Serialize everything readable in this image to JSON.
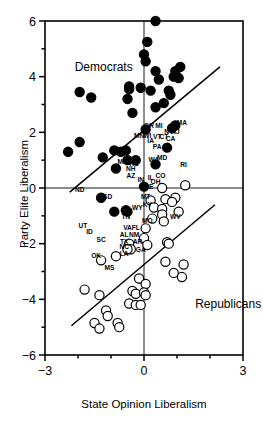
{
  "chart_data": {
    "type": "scatter",
    "title": "",
    "xlabel": "State Opinion Liberalism",
    "ylabel": "Party Elite Liberalism",
    "xlim": [
      -3,
      3
    ],
    "ylim": [
      -6,
      6
    ],
    "xticks": [
      -3,
      -2,
      -1,
      0,
      1,
      2,
      3
    ],
    "xticklabels": [
      "−3",
      "",
      "",
      "0",
      "",
      "",
      "3"
    ],
    "yticks": [
      -6,
      -5,
      -4,
      -3,
      -2,
      -1,
      0,
      1,
      2,
      3,
      4,
      5,
      6
    ],
    "yticklabels": [
      "−6",
      "",
      "−4",
      "",
      "−2",
      "",
      "0",
      "",
      "2",
      "",
      "4",
      "",
      "6"
    ],
    "grid": false,
    "legend_position": "in-plot annotations",
    "annotations": [
      {
        "text": "Democrats",
        "x": -2.1,
        "y": 4.2
      },
      {
        "text": "Republicans",
        "x": 1.55,
        "y": -4.3
      }
    ],
    "reference_lines": [
      {
        "name": "zero-vertical",
        "orientation": "vertical",
        "value": 0
      },
      {
        "name": "zero-horizontal",
        "orientation": "horizontal",
        "value": 0
      }
    ],
    "fit_lines": [
      {
        "name": "democrat-fit",
        "x": [
          -2.25,
          2.3
        ],
        "y": [
          -0.15,
          4.35
        ],
        "style": "solid"
      },
      {
        "name": "republican-fit",
        "x": [
          -2.2,
          2.15
        ],
        "y": [
          -4.95,
          -0.6
        ],
        "style": "solid"
      },
      {
        "name": "republican-upper-fit",
        "x": [
          -3.0,
          3.0
        ],
        "y": [
          -3.0,
          3.0
        ],
        "style": "solid"
      }
    ],
    "series": [
      {
        "name": "Democrats",
        "marker": "filled-circle",
        "color": "#000000",
        "points": [
          {
            "label": "",
            "x": 0.35,
            "y": 6.0
          },
          {
            "label": "",
            "x": 0.1,
            "y": 5.25
          },
          {
            "label": "",
            "x": 0.0,
            "y": 4.8
          },
          {
            "label": "",
            "x": 0.05,
            "y": 4.55
          },
          {
            "label": "",
            "x": 1.1,
            "y": 4.35
          },
          {
            "label": "",
            "x": 0.95,
            "y": 4.2
          },
          {
            "label": "",
            "x": 0.35,
            "y": 4.2
          },
          {
            "label": "",
            "x": 0.9,
            "y": 4.0
          },
          {
            "label": "",
            "x": 1.05,
            "y": 3.95
          },
          {
            "label": "",
            "x": 0.45,
            "y": 3.9
          },
          {
            "label": "",
            "x": -0.45,
            "y": 3.65
          },
          {
            "label": "",
            "x": -0.1,
            "y": 3.6
          },
          {
            "label": "",
            "x": -0.45,
            "y": 3.55
          },
          {
            "label": "",
            "x": 0.2,
            "y": 3.5
          },
          {
            "label": "",
            "x": 0.75,
            "y": 3.5
          },
          {
            "label": "",
            "x": 0.8,
            "y": 3.35
          },
          {
            "label": "",
            "x": -1.95,
            "y": 3.45
          },
          {
            "label": "",
            "x": -1.6,
            "y": 3.25
          },
          {
            "label": "",
            "x": -0.5,
            "y": 3.2
          },
          {
            "label": "",
            "x": 0.6,
            "y": 3.05
          },
          {
            "label": "",
            "x": -0.35,
            "y": 2.7
          },
          {
            "label": "",
            "x": 0.35,
            "y": 2.9
          },
          {
            "label": "MA",
            "x": 0.95,
            "y": 2.25
          },
          {
            "label": "OR",
            "x": 0.05,
            "y": 2.1
          },
          {
            "label": "NY",
            "x": 0.85,
            "y": 2.15
          },
          {
            "label": "CA",
            "x": 0.7,
            "y": 1.45
          },
          {
            "label": "",
            "x": -1.95,
            "y": 1.65
          },
          {
            "label": "",
            "x": -2.3,
            "y": 1.3
          },
          {
            "label": "",
            "x": -1.25,
            "y": 1.1
          },
          {
            "label": "",
            "x": -0.55,
            "y": 1.35
          },
          {
            "label": "",
            "x": -0.7,
            "y": 1.3
          },
          {
            "label": "",
            "x": -0.9,
            "y": 1.35
          },
          {
            "label": "ME",
            "x": -0.5,
            "y": 1.0
          },
          {
            "label": "KS",
            "x": -0.25,
            "y": 1.0
          },
          {
            "label": "WA",
            "x": 0.35,
            "y": 0.85
          },
          {
            "label": "",
            "x": -0.85,
            "y": 0.7
          },
          {
            "label": "IN",
            "x": 0.0,
            "y": 0.05
          },
          {
            "label": "SD",
            "x": -1.3,
            "y": -0.35
          },
          {
            "label": "",
            "x": -0.9,
            "y": -0.85
          },
          {
            "label": "",
            "x": -0.55,
            "y": -0.8
          },
          {
            "label": "",
            "x": -0.5,
            "y": -0.85
          }
        ]
      },
      {
        "name": "Republicans",
        "marker": "open-circle",
        "color": "#000000",
        "points": [
          {
            "label": "RI",
            "x": 1.25,
            "y": 0.1
          },
          {
            "label": "CO",
            "x": 0.55,
            "y": 0.0
          },
          {
            "label": "MT",
            "x": 0.2,
            "y": -0.45
          },
          {
            "label": "",
            "x": 0.65,
            "y": -0.4
          },
          {
            "label": "",
            "x": 0.95,
            "y": -0.35
          },
          {
            "label": "",
            "x": 0.85,
            "y": -0.5
          },
          {
            "label": "KY",
            "x": 0.3,
            "y": -0.7
          },
          {
            "label": "WV",
            "x": 1.05,
            "y": -0.85
          },
          {
            "label": "",
            "x": 0.55,
            "y": -0.75
          },
          {
            "label": "",
            "x": 0.55,
            "y": -0.95
          },
          {
            "label": "MO",
            "x": 0.25,
            "y": -1.1
          },
          {
            "label": "",
            "x": 0.6,
            "y": -1.2
          },
          {
            "label": "NM",
            "x": 0.05,
            "y": -1.45
          },
          {
            "label": "AR",
            "x": 0.0,
            "y": -1.8
          },
          {
            "label": "GA",
            "x": 0.1,
            "y": -2.05
          },
          {
            "label": "",
            "x": 0.7,
            "y": -1.95
          },
          {
            "label": "",
            "x": 0.75,
            "y": -2.0
          },
          {
            "label": "NC",
            "x": -0.45,
            "y": -2.0
          },
          {
            "label": "LA",
            "x": -0.4,
            "y": -2.2
          },
          {
            "label": "",
            "x": -0.5,
            "y": -2.2
          },
          {
            "label": "MS",
            "x": -0.85,
            "y": -2.45
          },
          {
            "label": "OK",
            "x": -1.3,
            "y": -2.6
          },
          {
            "label": "",
            "x": 0.65,
            "y": -2.65
          },
          {
            "label": "",
            "x": 1.2,
            "y": -2.75
          },
          {
            "label": "",
            "x": 0.9,
            "y": -3.05
          },
          {
            "label": "",
            "x": 1.15,
            "y": -3.2
          },
          {
            "label": "",
            "x": -0.15,
            "y": -3.25
          },
          {
            "label": "",
            "x": 0.05,
            "y": -3.45
          },
          {
            "label": "",
            "x": -1.8,
            "y": -3.65
          },
          {
            "label": "",
            "x": -0.35,
            "y": -3.7
          },
          {
            "label": "",
            "x": -0.25,
            "y": -3.8
          },
          {
            "label": "",
            "x": 0.0,
            "y": -3.75
          },
          {
            "label": "",
            "x": 0.05,
            "y": -3.85
          },
          {
            "label": "",
            "x": -1.35,
            "y": -3.85
          },
          {
            "label": "",
            "x": -0.45,
            "y": -4.15
          },
          {
            "label": "",
            "x": -0.25,
            "y": -4.2
          },
          {
            "label": "",
            "x": -0.1,
            "y": -4.2
          },
          {
            "label": "",
            "x": -1.15,
            "y": -4.4
          },
          {
            "label": "",
            "x": -1.1,
            "y": -4.6
          },
          {
            "label": "",
            "x": -1.5,
            "y": -4.85
          },
          {
            "label": "",
            "x": -0.8,
            "y": -4.85
          },
          {
            "label": "",
            "x": -0.75,
            "y": -5.0
          },
          {
            "label": "",
            "x": -1.35,
            "y": -5.05
          }
        ]
      }
    ],
    "point_labels": [
      {
        "text": "ND",
        "x": -1.95,
        "y": -0.15
      },
      {
        "text": "SD",
        "x": -1.1,
        "y": -0.4
      },
      {
        "text": "UT",
        "x": -1.85,
        "y": -1.45
      },
      {
        "text": "ID",
        "x": -1.65,
        "y": -1.65
      },
      {
        "text": "SC",
        "x": -1.3,
        "y": -1.95
      },
      {
        "text": "OK",
        "x": -1.45,
        "y": -2.5
      },
      {
        "text": "MS",
        "x": -1.05,
        "y": -2.95
      },
      {
        "text": "TN",
        "x": -0.55,
        "y": -1.1
      },
      {
        "text": "VA",
        "x": -0.5,
        "y": -1.5
      },
      {
        "text": "FL",
        "x": -0.25,
        "y": -1.5
      },
      {
        "text": "AL",
        "x": -0.6,
        "y": -1.75
      },
      {
        "text": "NM",
        "x": -0.3,
        "y": -1.75
      },
      {
        "text": "TX",
        "x": -0.6,
        "y": -2.0
      },
      {
        "text": "AR",
        "x": -0.2,
        "y": -2.0
      },
      {
        "text": "NC",
        "x": -0.6,
        "y": -2.2
      },
      {
        "text": "LA",
        "x": -0.6,
        "y": -2.45
      },
      {
        "text": "GA",
        "x": -0.1,
        "y": -2.3
      },
      {
        "text": "MO",
        "x": 0.1,
        "y": -1.25
      },
      {
        "text": "WY",
        "x": -0.2,
        "y": -0.8
      },
      {
        "text": "KY",
        "x": 0.1,
        "y": -0.7
      },
      {
        "text": "MT",
        "x": 0.05,
        "y": -0.4
      },
      {
        "text": "WV",
        "x": 0.95,
        "y": -1.1
      },
      {
        "text": "DE",
        "x": 0.15,
        "y": -0.05
      },
      {
        "text": "OH",
        "x": 0.35,
        "y": 0.15
      },
      {
        "text": "CO",
        "x": 0.5,
        "y": 0.35
      },
      {
        "text": "IL",
        "x": 0.2,
        "y": 0.3
      },
      {
        "text": "RI",
        "x": 1.2,
        "y": 0.75
      },
      {
        "text": "MD",
        "x": 0.55,
        "y": 1.0
      },
      {
        "text": "WA",
        "x": 0.3,
        "y": 0.95
      },
      {
        "text": "IN",
        "x": -0.1,
        "y": 0.2
      },
      {
        "text": "AZ",
        "x": -0.4,
        "y": 0.35
      },
      {
        "text": "NH",
        "x": -0.4,
        "y": 0.6
      },
      {
        "text": "ME",
        "x": -0.65,
        "y": 0.85
      },
      {
        "text": "KS",
        "x": -0.3,
        "y": 0.8
      },
      {
        "text": "IA",
        "x": 0.2,
        "y": 1.6
      },
      {
        "text": "PA",
        "x": 0.4,
        "y": 1.4
      },
      {
        "text": "VT",
        "x": 0.4,
        "y": 1.75
      },
      {
        "text": "CT",
        "x": 0.6,
        "y": 1.75
      },
      {
        "text": "CA",
        "x": 0.8,
        "y": 1.7
      },
      {
        "text": "MI",
        "x": 0.45,
        "y": 2.15
      },
      {
        "text": "NY",
        "x": 0.75,
        "y": 1.95
      },
      {
        "text": "NJ",
        "x": 0.95,
        "y": 1.95
      },
      {
        "text": "MA",
        "x": 1.15,
        "y": 2.25
      },
      {
        "text": "OR",
        "x": 0.15,
        "y": 2.15
      },
      {
        "text": "MN",
        "x": -0.15,
        "y": 1.8
      },
      {
        "text": "WI",
        "x": 0.1,
        "y": 1.8
      }
    ]
  }
}
